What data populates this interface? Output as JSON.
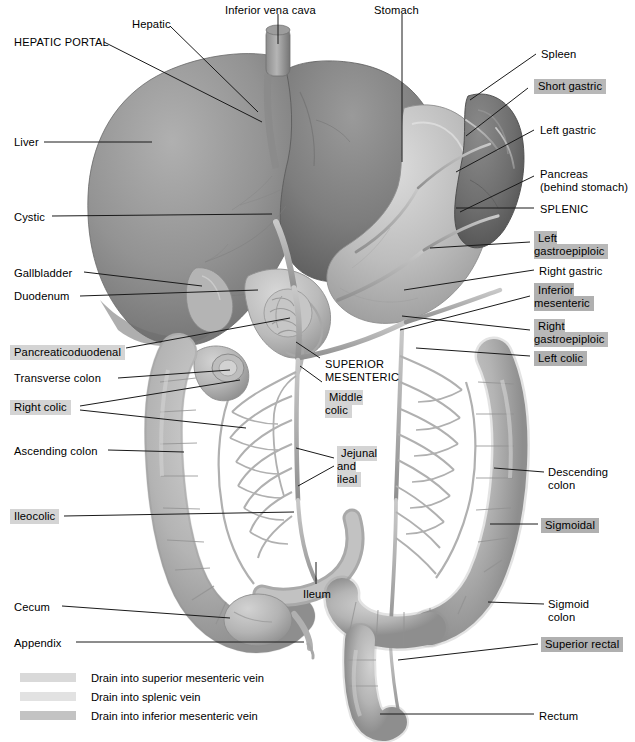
{
  "figure": {
    "type": "anatomical-diagram"
  },
  "labels": [
    {
      "id": "hepatic-portal",
      "text": "HEPATIC PORTAL",
      "style": "plain",
      "x": 14,
      "y": 36
    },
    {
      "id": "hepatic",
      "text": "Hepatic",
      "style": "plain",
      "x": 132,
      "y": 18
    },
    {
      "id": "inferior-vena-cava",
      "text": "Inferior vena cava",
      "style": "plain",
      "x": 225,
      "y": 4
    },
    {
      "id": "stomach",
      "text": "Stomach",
      "style": "plain",
      "x": 374,
      "y": 4
    },
    {
      "id": "spleen",
      "text": "Spleen",
      "style": "plain",
      "x": 541,
      "y": 48
    },
    {
      "id": "short-gastric",
      "text": "Short gastric",
      "style": "splenic",
      "x": 534,
      "y": 80
    },
    {
      "id": "left-gastric",
      "text": "Left gastric",
      "style": "plain",
      "x": 540,
      "y": 124
    },
    {
      "id": "pancreas",
      "text": "Pancreas\n(behind stomach)",
      "style": "plain",
      "x": 540,
      "y": 168
    },
    {
      "id": "splenic",
      "text": "SPLENIC",
      "style": "plain",
      "x": 540,
      "y": 203
    },
    {
      "id": "left-gastroepiploic",
      "text": "Left\ngastroepiploic",
      "style": "splenic",
      "x": 534,
      "y": 232
    },
    {
      "id": "right-gastric",
      "text": "Right gastric",
      "style": "plain",
      "x": 539,
      "y": 265
    },
    {
      "id": "inferior-mesenteric",
      "text": "Inferior\nmesenteric",
      "style": "imv",
      "x": 534,
      "y": 284
    },
    {
      "id": "right-gastroepiploic",
      "text": "Right\ngastroepiploic",
      "style": "splenic",
      "x": 534,
      "y": 320
    },
    {
      "id": "left-colic",
      "text": "Left colic",
      "style": "imv",
      "x": 534,
      "y": 352
    },
    {
      "id": "liver",
      "text": "Liver",
      "style": "plain",
      "x": 14,
      "y": 136
    },
    {
      "id": "cystic",
      "text": "Cystic",
      "style": "plain",
      "x": 14,
      "y": 211
    },
    {
      "id": "gallbladder",
      "text": "Gallbladder",
      "style": "plain",
      "x": 14,
      "y": 267
    },
    {
      "id": "duodenum",
      "text": "Duodenum",
      "style": "plain",
      "x": 14,
      "y": 290
    },
    {
      "id": "pancreaticoduodenal",
      "text": "Pancreaticoduodenal",
      "style": "smv",
      "x": 10,
      "y": 346
    },
    {
      "id": "transverse-colon",
      "text": "Transverse colon",
      "style": "plain",
      "x": 14,
      "y": 372
    },
    {
      "id": "right-colic",
      "text": "Right colic",
      "style": "smv",
      "x": 10,
      "y": 401
    },
    {
      "id": "ascending-colon",
      "text": "Ascending colon",
      "style": "plain",
      "x": 14,
      "y": 445
    },
    {
      "id": "ileocolic",
      "text": "Ileocolic",
      "style": "smv",
      "x": 10,
      "y": 510
    },
    {
      "id": "cecum",
      "text": "Cecum",
      "style": "plain",
      "x": 14,
      "y": 601
    },
    {
      "id": "appendix",
      "text": "Appendix",
      "style": "plain",
      "x": 14,
      "y": 637
    },
    {
      "id": "superior-mesenteric",
      "text": "SUPERIOR\nMESENTERIC",
      "style": "plain",
      "x": 325,
      "y": 358
    },
    {
      "id": "middle-colic",
      "text": "Middle\ncolic",
      "style": "smv",
      "x": 325,
      "y": 391
    },
    {
      "id": "jejunal-and-ileal",
      "text": "Jejunal\nand\nileal",
      "style": "smv",
      "x": 337,
      "y": 447
    },
    {
      "id": "ileum",
      "text": "Ileum",
      "style": "plain",
      "x": 303,
      "y": 588
    },
    {
      "id": "descending-colon",
      "text": "Descending\ncolon",
      "style": "plain",
      "x": 548,
      "y": 466
    },
    {
      "id": "sigmoidal",
      "text": "Sigmoidal",
      "style": "imv",
      "x": 541,
      "y": 519
    },
    {
      "id": "sigmoid-colon",
      "text": "Sigmoid\ncolon",
      "style": "plain",
      "x": 548,
      "y": 598
    },
    {
      "id": "superior-rectal",
      "text": "Superior rectal",
      "style": "imv",
      "x": 541,
      "y": 638
    },
    {
      "id": "rectum",
      "text": "Rectum",
      "style": "plain",
      "x": 539,
      "y": 710
    }
  ],
  "legend": {
    "items": [
      {
        "id": "legend-smv",
        "swatch": "#d9d9d9",
        "text": "Drain into superior mesenteric vein"
      },
      {
        "id": "legend-splenic",
        "swatch": "#e2e2e2",
        "text": "Drain into splenic vein"
      },
      {
        "id": "legend-imv",
        "swatch": "#c3c3c3",
        "text": "Drain into inferior mesenteric vein"
      }
    ]
  },
  "colors": {
    "organ_dark": "#7d7d7d",
    "organ_mid": "#9a9a9a",
    "organ_light": "#b9b9b9",
    "vessel": "#b4b4b4",
    "leader_line": "#1a1a1a",
    "background": "#ffffff"
  }
}
